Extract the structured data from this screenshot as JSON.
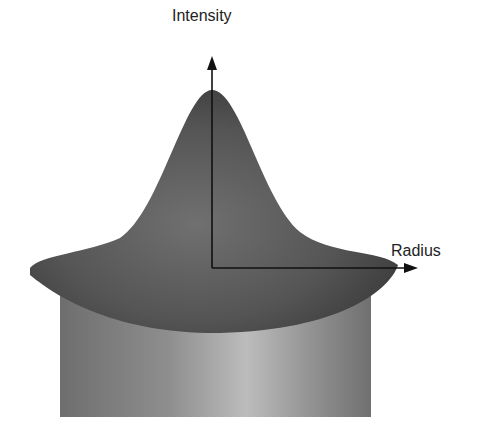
{
  "diagram": {
    "axes": {
      "vertical_label": "Intensity",
      "horizontal_label": "Radius"
    },
    "colors": {
      "background": "#ffffff",
      "gaussian_dark": "#3a3a3a",
      "gaussian_mid": "#6a6a6a",
      "cylinder_edge": "#707070",
      "cylinder_highlight": "#bdbdbd",
      "axis": "#111111"
    }
  }
}
